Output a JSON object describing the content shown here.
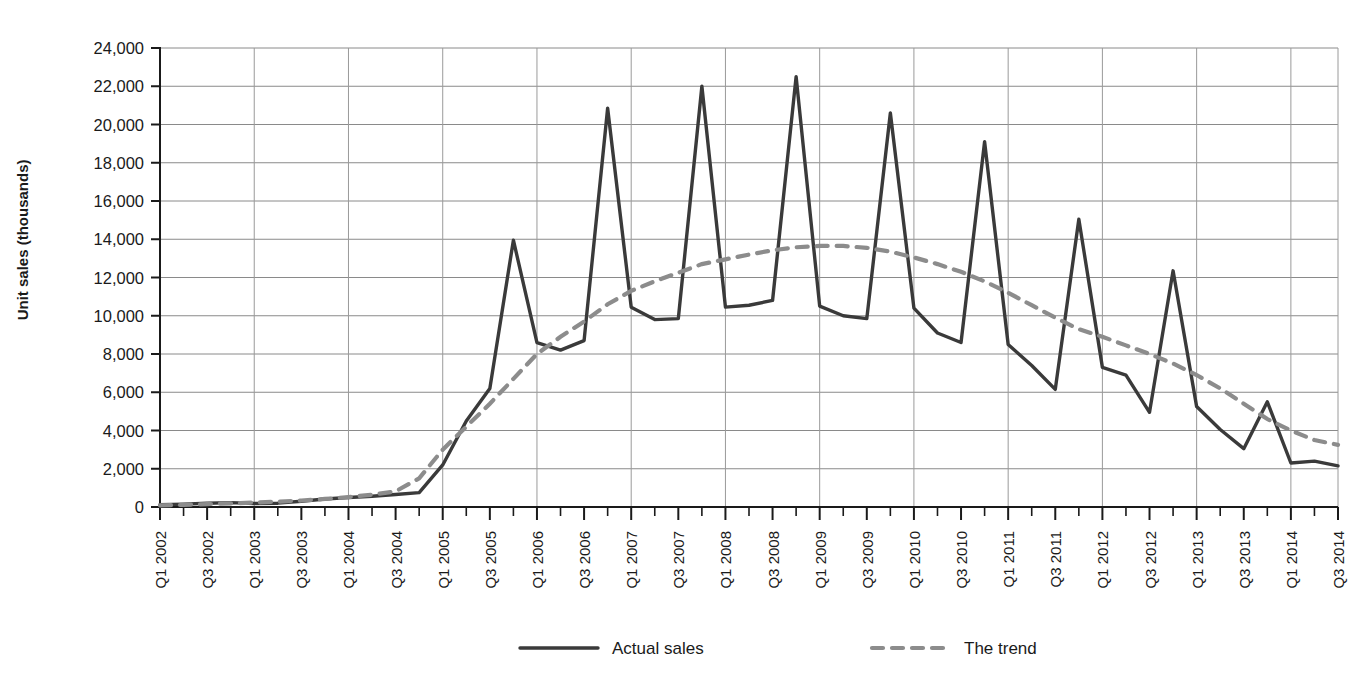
{
  "chart_data": {
    "type": "line",
    "title": "",
    "xlabel": "",
    "ylabel": "Unit sales (thousands)",
    "ylim": [
      0,
      24000
    ],
    "ytick_step": 2000,
    "ytick_labels": [
      "0",
      "2,000",
      "4,000",
      "6,000",
      "8,000",
      "10,000",
      "12,000",
      "14,000",
      "16,000",
      "18,000",
      "20,000",
      "22,000",
      "24,000"
    ],
    "grid": true,
    "legend_position": "bottom",
    "x": [
      "Q1 2002",
      "Q2 2002",
      "Q3 2002",
      "Q4 2002",
      "Q1 2003",
      "Q2 2003",
      "Q3 2003",
      "Q4 2003",
      "Q1 2004",
      "Q2 2004",
      "Q3 2004",
      "Q4 2004",
      "Q1 2005",
      "Q2 2005",
      "Q3 2005",
      "Q4 2005",
      "Q1 2006",
      "Q2 2006",
      "Q3 2006",
      "Q4 2006",
      "Q1 2007",
      "Q2 2007",
      "Q3 2007",
      "Q4 2007",
      "Q1 2008",
      "Q2 2008",
      "Q3 2008",
      "Q4 2008",
      "Q1 2009",
      "Q2 2009",
      "Q3 2009",
      "Q4 2009",
      "Q1 2010",
      "Q2 2010",
      "Q3 2010",
      "Q4 2010",
      "Q1 2011",
      "Q2 2011",
      "Q3 2011",
      "Q4 2011",
      "Q1 2012",
      "Q2 2012",
      "Q3 2012",
      "Q4 2012",
      "Q1 2013",
      "Q2 2013",
      "Q3 2013",
      "Q4 2013",
      "Q1 2014",
      "Q2 2014",
      "Q3 2014"
    ],
    "xtick_labels_shown": [
      "Q1 2002",
      "Q3 2002",
      "Q1 2003",
      "Q3 2003",
      "Q1 2004",
      "Q3 2004",
      "Q1 2005",
      "Q3 2005",
      "Q1 2006",
      "Q3 2006",
      "Q1 2007",
      "Q3 2007",
      "Q1 2008",
      "Q3 2008",
      "Q1 2009",
      "Q3 2009",
      "Q1 2010",
      "Q3 2010",
      "Q1 2011",
      "Q3 2011",
      "Q1 2012",
      "Q3 2012",
      "Q1 2013",
      "Q3 2013",
      "Q1 2014",
      "Q3 2014"
    ],
    "series": [
      {
        "name": "Actual sales",
        "style": "solid",
        "color": "#3a3a3a",
        "values": [
          120,
          150,
          200,
          230,
          180,
          200,
          300,
          420,
          500,
          560,
          650,
          750,
          2200,
          4500,
          6200,
          13950,
          8600,
          8200,
          8700,
          20850,
          10450,
          9800,
          9850,
          22000,
          10450,
          10550,
          10800,
          22500,
          10500,
          10000,
          9850,
          20600,
          10400,
          9100,
          8600,
          19100,
          8500,
          7400,
          6150,
          15050,
          7300,
          6900,
          4950,
          12350,
          5250,
          4050,
          3050,
          5500,
          2300,
          2400,
          2150
        ]
      },
      {
        "name": "The trend",
        "style": "dashed",
        "color": "#8c8c8c",
        "values": [
          80,
          110,
          150,
          190,
          230,
          280,
          340,
          420,
          520,
          640,
          820,
          1500,
          3000,
          4200,
          5400,
          6700,
          8000,
          8900,
          9700,
          10600,
          11300,
          11800,
          12250,
          12700,
          12950,
          13200,
          13420,
          13580,
          13650,
          13650,
          13550,
          13350,
          13050,
          12700,
          12300,
          11800,
          11200,
          10550,
          9900,
          9300,
          8900,
          8450,
          8000,
          7500,
          6900,
          6200,
          5400,
          4600,
          4000,
          3500,
          3250
        ]
      }
    ]
  },
  "legend": {
    "items": [
      {
        "label": "Actual sales",
        "style": "solid"
      },
      {
        "label": "The trend",
        "style": "dashed"
      }
    ]
  }
}
